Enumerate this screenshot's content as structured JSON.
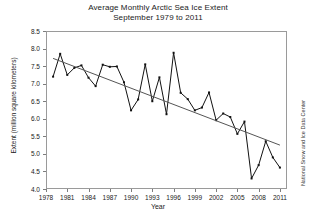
{
  "chart_data": {
    "type": "line",
    "title": "Average Monthly Arctic Sea Ice Extent",
    "subtitle": "September 1979 to 2011",
    "xlabel": "Year",
    "ylabel": "Extent (million square kilometers)",
    "credit": "National Snow and Ice Data Center",
    "xlim": [
      1978,
      2012
    ],
    "ylim": [
      4.0,
      8.5
    ],
    "ytick_labels": [
      "8.5",
      "8.0",
      "7.5",
      "7.0",
      "6.5",
      "6.0",
      "5.5",
      "5.0",
      "4.5",
      "4.0"
    ],
    "ytick_values": [
      8.5,
      8.0,
      7.5,
      7.0,
      6.5,
      6.0,
      5.5,
      5.0,
      4.5,
      4.0
    ],
    "xtick_labels": [
      "1978",
      "1981",
      "1984",
      "1987",
      "1990",
      "1993",
      "1996",
      "1999",
      "2002",
      "2005",
      "2008",
      "2011"
    ],
    "xtick_values": [
      1978,
      1981,
      1984,
      1987,
      1990,
      1993,
      1996,
      1999,
      2002,
      2005,
      2008,
      2011
    ],
    "grid": false,
    "legend": "none",
    "marker": "square",
    "series": [
      {
        "name": "September sea ice extent",
        "x": [
          1979,
          1980,
          1981,
          1982,
          1983,
          1984,
          1985,
          1986,
          1987,
          1988,
          1989,
          1990,
          1991,
          1992,
          1993,
          1994,
          1995,
          1996,
          1997,
          1998,
          1999,
          2000,
          2001,
          2002,
          2003,
          2004,
          2005,
          2006,
          2007,
          2008,
          2009,
          2010,
          2011
        ],
        "values": [
          7.2,
          7.85,
          7.25,
          7.45,
          7.52,
          7.17,
          6.93,
          7.54,
          7.48,
          7.49,
          7.04,
          6.24,
          6.55,
          7.55,
          6.5,
          7.18,
          6.13,
          7.88,
          6.74,
          6.56,
          6.24,
          6.32,
          6.75,
          5.96,
          6.15,
          6.05,
          5.57,
          5.92,
          4.3,
          4.68,
          5.36,
          4.9,
          4.61
        ]
      }
    ],
    "trendline": {
      "name": "linear trend",
      "x_start": 1979,
      "x_end": 2011,
      "y_start": 7.72,
      "y_end": 5.25
    }
  }
}
